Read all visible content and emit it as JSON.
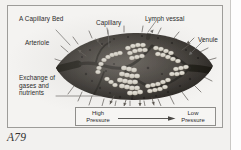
{
  "figure": {
    "title": "A Capillary Bed",
    "caption": "A79"
  },
  "labels": [
    {
      "id": "title",
      "text": "A Capillary Bed",
      "name": "label-a-capillary-bed"
    },
    {
      "id": "capillary",
      "text": "Capillary",
      "name": "label-capillary"
    },
    {
      "id": "lymph",
      "text": "Lymph vessal",
      "name": "label-lymph-vessal"
    },
    {
      "id": "venule",
      "text": "Venule",
      "name": "label-venule"
    },
    {
      "id": "arteriole",
      "text": "Arteriole",
      "name": "label-arteriole"
    },
    {
      "id": "exchange",
      "text": "Exchange of\ngases and\nnutrients",
      "name": "label-exchange-of-gases-and-nutrients"
    }
  ],
  "pressure_legend": {
    "left_label": "High\nPressure",
    "right_label": "Low\nPressure",
    "arrow_direction": "left-to-right"
  },
  "colors": {
    "page_background": "#f2f1ef",
    "panel_background": "#f4f3f1",
    "panel_border": "#9d9c99",
    "text": "#2b2b2b",
    "tissue_dark": "#2e2b28",
    "tissue_mid": "#4a4540",
    "capillary_light": "#e8e5dd",
    "leader_line": "#6d6c69",
    "caption": "#333333"
  }
}
